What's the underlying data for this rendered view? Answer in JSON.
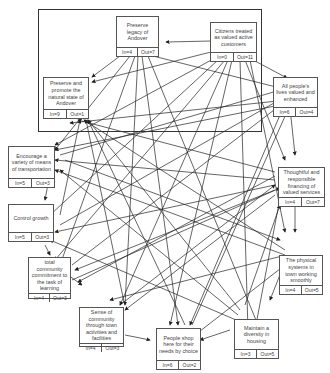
{
  "diagram": {
    "type": "interrelationship-digraph",
    "nodes": [
      {
        "id": "legacy",
        "label": "Preserve legacy of Andover",
        "in": "In=4",
        "out": "Out=7"
      },
      {
        "id": "citizens",
        "label": "Citizens treated as valued active customers",
        "in": "In=0",
        "out": "Out=11"
      },
      {
        "id": "natural",
        "label": "Preserve and promote the natural state of Andover",
        "in": "In=9",
        "out": "Out=1"
      },
      {
        "id": "lives",
        "label": "All people's lives valued and enhanced",
        "in": "In=6",
        "out": "Out=4"
      },
      {
        "id": "transport",
        "label": "Encourage a variety of means of transportation",
        "in": "In=5",
        "out": "Out=3"
      },
      {
        "id": "financing",
        "label": "Thoughtful and responsible financing of valued services",
        "in": "In=4",
        "out": "Out=7"
      },
      {
        "id": "growth",
        "label": "Control growth",
        "in": "In=5",
        "out": "Out=3"
      },
      {
        "id": "learning",
        "label": "total community commitment to the task of learning",
        "in": "In=4",
        "out": "Out=3"
      },
      {
        "id": "physical",
        "label": "The physical systems in town working smoothly",
        "in": "In=4",
        "out": "Out=5"
      },
      {
        "id": "sense",
        "label": "Sense of community through town activities and facilities",
        "in": "In=4",
        "out": "Out=3"
      },
      {
        "id": "shop",
        "label": "People shop here for their needs by choice",
        "in": "In=6",
        "out": "Out=2"
      },
      {
        "id": "housing",
        "label": "Maintain a diversity in housing",
        "in": "In=3",
        "out": "Out=5"
      }
    ]
  }
}
